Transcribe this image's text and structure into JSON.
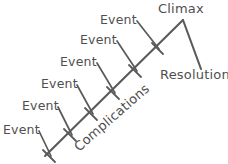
{
  "diagram": {
    "type": "story-arc",
    "stroke_color": "#5a5a5a",
    "text_color": "#4f4f4f",
    "background_color": "#ffffff",
    "labels": {
      "climax": "Climax",
      "resolution": "Resolution",
      "complications": "Complications",
      "event": "Event"
    },
    "events": [
      {
        "label": "Event",
        "x": 100,
        "y": 14
      },
      {
        "label": "Event",
        "x": 80,
        "y": 34
      },
      {
        "label": "Event",
        "x": 60,
        "y": 56
      },
      {
        "label": "Event",
        "x": 41,
        "y": 78
      },
      {
        "label": "Event",
        "x": 22,
        "y": 100
      },
      {
        "label": "Event",
        "x": 3,
        "y": 124
      }
    ],
    "climax": {
      "label": "Climax",
      "x": 158,
      "y": 2
    },
    "resolution": {
      "label": "Resolution",
      "x": 160,
      "y": 68
    },
    "complications": {
      "label": "Complications",
      "x": 76,
      "y": 142,
      "rotation": -41
    }
  }
}
